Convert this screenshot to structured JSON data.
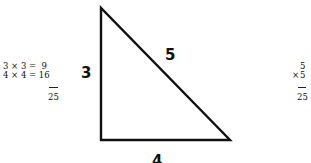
{
  "left_work": {
    "line1": "3 × 3 =  9",
    "line2": "4 × 4 = 16",
    "sum": "25"
  },
  "triangle": {
    "vertices": {
      "top": [
        101,
        8
      ],
      "bottom_left": [
        101,
        140
      ],
      "bottom_right": [
        230,
        140
      ]
    },
    "labels": {
      "vertical_side": "3",
      "hypotenuse": "5",
      "base": "4"
    },
    "stroke_color": "#111111"
  },
  "right_work": {
    "top": "5",
    "multiplier_sign": "×",
    "multiplier": "5",
    "product": "25"
  }
}
